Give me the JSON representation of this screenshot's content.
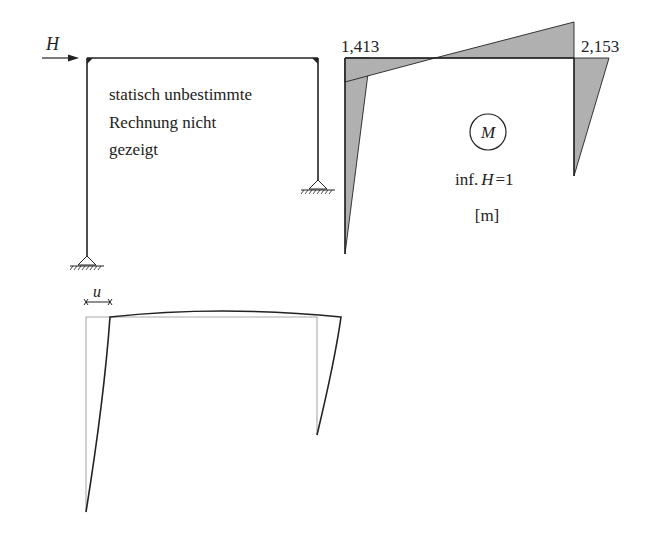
{
  "frame_panel": {
    "load_label": "H",
    "note_lines": [
      "statisch unbestimmte",
      "Rechnung nicht",
      "gezeigt"
    ]
  },
  "moment_panel": {
    "left_corner_value": "1,413",
    "right_corner_value": "2,153",
    "diagram_symbol": "M",
    "influence_label_prefix": "inf.",
    "influence_label_var": "H",
    "influence_label_eq": "=1",
    "unit_label": "[m]",
    "fill_color": "#b0b0b0",
    "line_color": "#222222"
  },
  "deformation_panel": {
    "displacement_label": "u",
    "undeformed_color": "#aaaaaa",
    "deformed_color": "#222222"
  }
}
